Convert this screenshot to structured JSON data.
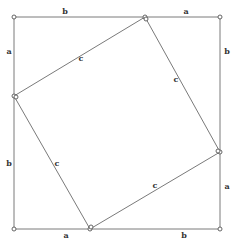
{
  "diagram": {
    "colors": {
      "line": "#7a7a7a",
      "vertex_stroke": "#555555",
      "label": "#333333",
      "background": "#ffffff"
    },
    "outer_square": {
      "top_left": [
        14,
        17
      ],
      "top_right": [
        220,
        17
      ],
      "bottom_right": [
        220,
        229
      ],
      "bottom_left": [
        14,
        229
      ]
    },
    "inner_square": {
      "top": [
        145,
        17
      ],
      "right": [
        220,
        152
      ],
      "bottom": [
        90,
        229
      ],
      "left": [
        14,
        96
      ]
    },
    "labels": {
      "top_left_segment": "b",
      "top_right_segment": "a",
      "right_upper_segment": "b",
      "right_lower_segment": "a",
      "bottom_right_segment": "b",
      "bottom_left_segment": "a",
      "left_lower_segment": "b",
      "left_upper_segment": "a",
      "inner_top_left_side": "c",
      "inner_top_right_side": "c",
      "inner_bottom_right_side": "c",
      "inner_bottom_left_side": "c"
    }
  }
}
